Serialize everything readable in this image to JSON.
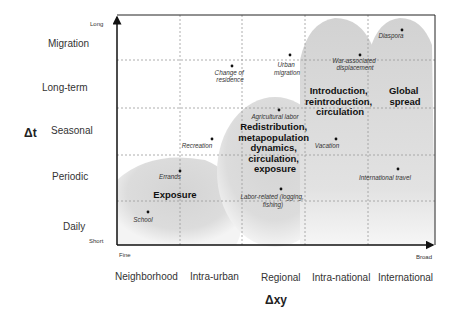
{
  "y_axis": {
    "title": "Δt",
    "low_label": "Short",
    "high_label": "Long",
    "categories": [
      "Daily",
      "Periodic",
      "Seasonal",
      "Long-term",
      "Migration"
    ]
  },
  "x_axis": {
    "title": "Δxy",
    "low_label": "Fine",
    "high_label": "Broad",
    "categories": [
      "Neighborhood",
      "Intra-urban",
      "Regional",
      "Intra-national",
      "International"
    ]
  },
  "zones": [
    {
      "id": "exposure",
      "lines": [
        "Exposure"
      ]
    },
    {
      "id": "redistribution",
      "lines": [
        "Redistribution,",
        "metapopulation",
        "dynamics,",
        "circulation,",
        "exposure"
      ]
    },
    {
      "id": "introduction",
      "lines": [
        "Introduction,",
        "reintroduction,",
        "circulation"
      ]
    },
    {
      "id": "global",
      "lines": [
        "Global",
        "spread"
      ]
    }
  ],
  "points": [
    {
      "lines": [
        "School"
      ]
    },
    {
      "lines": [
        "Errands"
      ]
    },
    {
      "lines": [
        "Recreation"
      ]
    },
    {
      "lines": [
        "Change of",
        "residence"
      ]
    },
    {
      "lines": [
        "Urban",
        "migration"
      ]
    },
    {
      "lines": [
        "Agricultural labor"
      ]
    },
    {
      "lines": [
        "Labor-related (logging,",
        "fishing)"
      ]
    },
    {
      "lines": [
        "Vacation"
      ]
    },
    {
      "lines": [
        "War-associated",
        "displacement"
      ]
    },
    {
      "lines": [
        "Diaspora"
      ]
    },
    {
      "lines": [
        "International travel"
      ]
    }
  ]
}
